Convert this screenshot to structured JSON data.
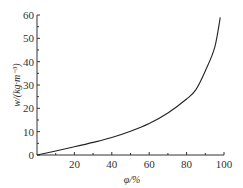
{
  "chart_data": {
    "type": "line",
    "title": "",
    "xlabel": "φ/%",
    "ylabel": "w/(kg·m⁻³)",
    "xlim": [
      0,
      100
    ],
    "ylim": [
      0,
      60
    ],
    "xticks": [
      "20",
      "40",
      "60",
      "80",
      "100"
    ],
    "yticks": [
      "0",
      "10",
      "20",
      "30",
      "40",
      "50",
      "60"
    ],
    "grid": false,
    "legend": null,
    "series": [
      {
        "name": "w",
        "x": [
          0,
          10,
          20,
          30,
          40,
          50,
          60,
          70,
          80,
          85,
          90,
          95,
          98
        ],
        "y": [
          0,
          1.7,
          3.5,
          5.4,
          7.5,
          10.2,
          13.5,
          18,
          24,
          28,
          36,
          46,
          59
        ]
      }
    ]
  }
}
